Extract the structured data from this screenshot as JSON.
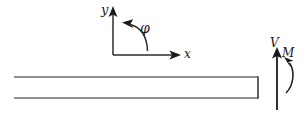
{
  "figure": {
    "background_color": "#ffffff",
    "line_color": "#3a3a3a",
    "arrow_color": "#1a1a1a",
    "width": 302,
    "height": 116
  },
  "axes": {
    "origin": {
      "x": 113,
      "y": 55
    },
    "y_axis": {
      "label": "y",
      "from": {
        "x": 113,
        "y": 55
      },
      "to": {
        "x": 113,
        "y": 8
      },
      "arrow": "up"
    },
    "x_axis": {
      "label": "x",
      "from": {
        "x": 113,
        "y": 55
      },
      "to": {
        "x": 180,
        "y": 55
      },
      "arrow": "right"
    },
    "angle": {
      "label": "φ",
      "description": "counter-clockwise rotation angle arc from x-axis",
      "arrow": "counter-clockwise"
    }
  },
  "beam": {
    "name": "beam",
    "left_open": true,
    "left_x": 14,
    "right_x": 258,
    "top_y": 77,
    "bottom_y": 98
  },
  "loads": [
    {
      "name": "shear-force",
      "label": "V",
      "type": "straight-arrow",
      "direction": "up",
      "x": 277,
      "from_y": 110,
      "to_y": 47
    },
    {
      "name": "bending-moment",
      "label": "M",
      "type": "curved-arrow",
      "direction": "counter-clockwise",
      "arrow_end": "top"
    }
  ]
}
